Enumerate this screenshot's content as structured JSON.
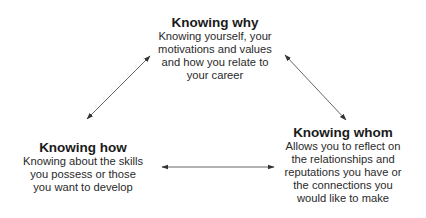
{
  "diagram": {
    "nodes": [
      {
        "id": "why",
        "title": "Knowing why",
        "lines": [
          "Knowing yourself, your",
          "motivations and values",
          "and how you relate to",
          "your career"
        ]
      },
      {
        "id": "how",
        "title": "Knowing how",
        "lines": [
          "Knowing about the skills",
          "you possess or those",
          "you want to develop"
        ]
      },
      {
        "id": "whom",
        "title": "Knowing whom",
        "lines": [
          "Allows you to reflect on",
          "the relationships and",
          "reputations you have or",
          "the connections you",
          "would like to make"
        ]
      }
    ],
    "edges": [
      {
        "from": "how",
        "to": "why",
        "type": "bidirectional-arrow"
      },
      {
        "from": "why",
        "to": "whom",
        "type": "bidirectional-arrow"
      },
      {
        "from": "how",
        "to": "whom",
        "type": "bidirectional-arrow"
      }
    ],
    "colors": {
      "text": "#222222",
      "arrow": "#555555",
      "background": "#ffffff"
    }
  }
}
